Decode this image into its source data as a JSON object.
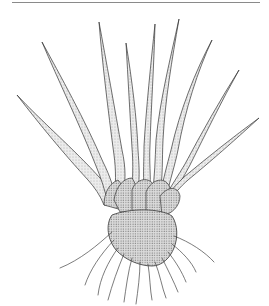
{
  "figure": {
    "colors": {
      "background": "#ffffff",
      "ink": "#333333",
      "stipple_fill": "#d9d9d9",
      "corm_fill": "#c8c8c8",
      "rule": "#8a8a8a"
    },
    "leaf_count": 9,
    "root_count": 12
  }
}
